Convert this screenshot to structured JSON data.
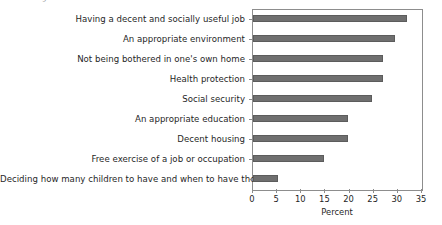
{
  "caption_fragment": "of social rights",
  "chart_data": {
    "type": "bar",
    "orientation": "horizontal",
    "title": "",
    "xlabel": "Percent",
    "ylabel": "",
    "xlim": [
      0,
      35
    ],
    "xticks": [
      0,
      5,
      10,
      15,
      20,
      25,
      30,
      35
    ],
    "grid": false,
    "legend": "none",
    "bar_color": "#6f6f6f",
    "frame_color": "#8d8d8d",
    "categories": [
      "Having a decent and socially useful job",
      "An appropriate environment",
      "Not being bothered in one's own home",
      "Health protection",
      "Social security",
      "An appropriate education",
      "Decent housing",
      "Free exercise of a job or occupation",
      "Deciding how many children to have and when to have them"
    ],
    "values": [
      31.9,
      29.4,
      26.9,
      26.9,
      24.6,
      19.7,
      19.6,
      14.7,
      5.2
    ]
  }
}
